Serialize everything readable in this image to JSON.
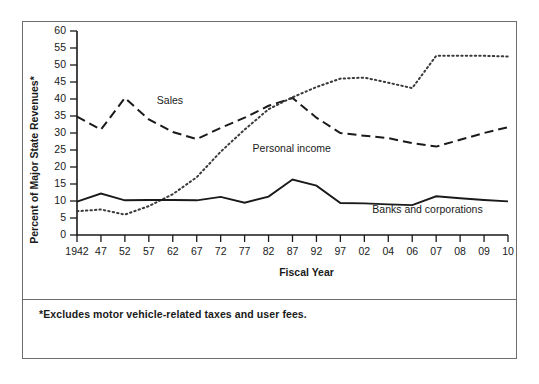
{
  "figure": {
    "footnote": "*Excludes motor vehicle-related taxes and user fees.",
    "ylabel": "Percent of Major State Revenues*",
    "xlabel": "Fiscal Year"
  },
  "chart_data": {
    "type": "line",
    "title": "",
    "xlabel": "Fiscal Year",
    "ylabel": "Percent of Major State Revenues*",
    "ylim": [
      0,
      60
    ],
    "yticks": [
      0,
      5,
      10,
      15,
      20,
      25,
      30,
      35,
      40,
      45,
      50,
      55,
      60
    ],
    "grid": false,
    "legend_position": "inline-labels",
    "footnote": "*Excludes motor vehicle-related taxes and user fees.",
    "categories": [
      "1942",
      "47",
      "52",
      "57",
      "62",
      "67",
      "72",
      "77",
      "82",
      "87",
      "92",
      "97",
      "02",
      "04",
      "06",
      "07",
      "08",
      "09",
      "10"
    ],
    "series": [
      {
        "name": "Sales",
        "style": "dashed",
        "label_anchor": {
          "x": "57",
          "y": 38.5
        },
        "values": [
          34.8,
          31.0,
          40.3,
          34.0,
          30.3,
          28.2,
          31.5,
          34.5,
          38.0,
          40.3,
          34.5,
          30.0,
          29.2,
          28.5,
          27.0,
          26.0,
          28.0,
          30.0,
          31.7
        ]
      },
      {
        "name": "Personal income",
        "style": "dotted",
        "label_anchor": {
          "x": "77",
          "y": 24.5
        },
        "values": [
          7.0,
          7.5,
          6.0,
          8.5,
          12.0,
          17.0,
          24.5,
          31.0,
          37.0,
          40.5,
          43.5,
          46.0,
          46.3,
          44.8,
          43.2,
          52.7,
          52.7,
          52.7,
          52.5
        ]
      },
      {
        "name": "Banks and corporations",
        "style": "solid",
        "label_anchor": {
          "x": "02",
          "y": 6.5
        },
        "values": [
          9.8,
          12.2,
          10.2,
          10.3,
          10.3,
          10.2,
          11.2,
          9.5,
          11.3,
          16.3,
          14.5,
          9.4,
          9.3,
          9.0,
          8.8,
          11.4,
          10.8,
          10.3,
          9.9
        ]
      }
    ]
  }
}
